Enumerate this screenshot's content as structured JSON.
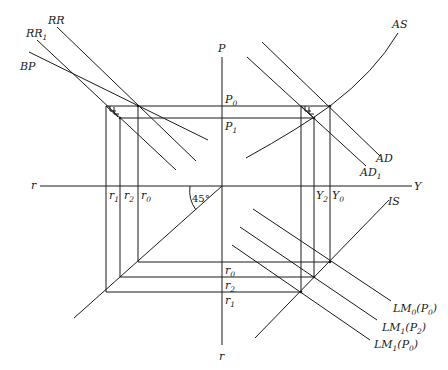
{
  "diagram": {
    "title": "",
    "type": "four-quadrant IS-LM / AD-AS diagram",
    "axes": {
      "vertical_top": "P",
      "vertical_bottom": "r",
      "horizontal_left": "r",
      "horizontal_right": "Y"
    },
    "angle_label": "45°",
    "curves": {
      "rr": "RR",
      "rr1_main": "RR",
      "rr1_sub": "1",
      "bp": "BP",
      "as": "AS",
      "ad": "AD",
      "ad1_main": "AD",
      "ad1_sub": "1",
      "is": "IS",
      "lm0": {
        "main": "LM",
        "sub": "0",
        "arg_open": "(P",
        "arg_sub": "0",
        "arg_close": ")"
      },
      "lm1p2": {
        "main": "LM",
        "sub": "1",
        "arg_open": "(P",
        "arg_sub": "2",
        "arg_close": ")"
      },
      "lm1p0": {
        "main": "LM",
        "sub": "1",
        "arg_open": "(P",
        "arg_sub": "0",
        "arg_close": ")"
      }
    },
    "price_levels": [
      {
        "main": "P",
        "sub": "0"
      },
      {
        "main": "P",
        "sub": "1"
      }
    ],
    "interest_rates_horizontal": [
      {
        "main": "r",
        "sub": "1"
      },
      {
        "main": "r",
        "sub": "2"
      },
      {
        "main": "r",
        "sub": "0"
      }
    ],
    "incomes": [
      {
        "main": "Y",
        "sub": "2"
      },
      {
        "main": "Y",
        "sub": "0"
      }
    ],
    "interest_rates_vertical": [
      {
        "main": "r",
        "sub": "0"
      },
      {
        "main": "r",
        "sub": "2"
      },
      {
        "main": "r",
        "sub": "1"
      }
    ]
  }
}
